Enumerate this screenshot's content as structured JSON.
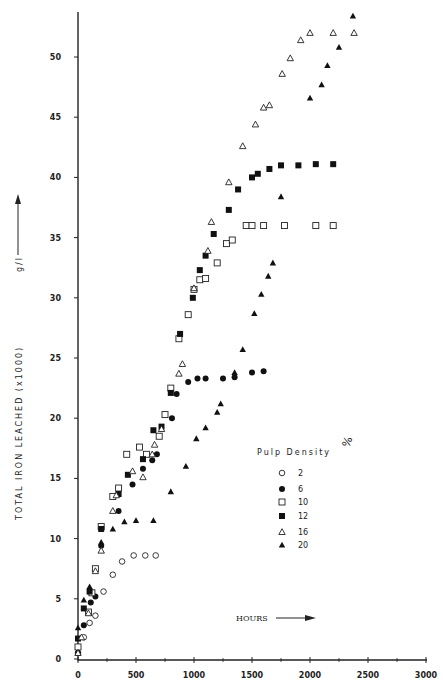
{
  "chart_data": {
    "type": "scatter",
    "title": "",
    "xlabel": "HOURS",
    "ylabel": "TOTAL IRON LEACHED (x1000) g/l",
    "xlim": [
      0,
      3000
    ],
    "ylim": [
      0,
      53
    ],
    "x_ticks": [
      "0",
      "500",
      "1000",
      "1500",
      "2000",
      "2500",
      "3000"
    ],
    "y_ticks": [
      "0",
      "5",
      "10",
      "15",
      "20",
      "25",
      "30",
      "35",
      "40",
      "45",
      "50"
    ],
    "grid": false,
    "legend": {
      "title": "Pulp Density",
      "unit": "%",
      "position": "right-middle",
      "entries": [
        {
          "label": "2",
          "marker": "open-circle"
        },
        {
          "label": "6",
          "marker": "filled-circle"
        },
        {
          "label": "10",
          "marker": "open-square"
        },
        {
          "label": "12",
          "marker": "filled-square"
        },
        {
          "label": "16",
          "marker": "open-triangle"
        },
        {
          "label": "20",
          "marker": "filled-triangle"
        }
      ]
    },
    "series": [
      {
        "name": "2",
        "marker": "open-circle",
        "points": [
          [
            0,
            0.5
          ],
          [
            50,
            1.8
          ],
          [
            100,
            3
          ],
          [
            150,
            3.6
          ],
          [
            220,
            5.6
          ],
          [
            300,
            7
          ],
          [
            380,
            8.1
          ],
          [
            480,
            8.6
          ],
          [
            580,
            8.6
          ],
          [
            670,
            8.6
          ]
        ]
      },
      {
        "name": "6",
        "marker": "filled-circle",
        "points": [
          [
            0,
            0.5
          ],
          [
            50,
            2.8
          ],
          [
            110,
            4.7
          ],
          [
            150,
            5.2
          ],
          [
            200,
            9.4
          ],
          [
            350,
            12.3
          ],
          [
            470,
            14.5
          ],
          [
            560,
            15.8
          ],
          [
            640,
            16.5
          ],
          [
            680,
            17
          ],
          [
            810,
            20
          ],
          [
            850,
            22
          ],
          [
            950,
            23
          ],
          [
            1030,
            23.3
          ],
          [
            1100,
            23.3
          ],
          [
            1250,
            23.3
          ],
          [
            1350,
            23.4
          ],
          [
            1500,
            23.8
          ],
          [
            1600,
            23.9
          ]
        ]
      },
      {
        "name": "10",
        "marker": "open-square",
        "points": [
          [
            0,
            1
          ],
          [
            90,
            3.9
          ],
          [
            120,
            5.5
          ],
          [
            150,
            7.5
          ],
          [
            200,
            11
          ],
          [
            300,
            13.5
          ],
          [
            350,
            14.2
          ],
          [
            420,
            17
          ],
          [
            530,
            17.6
          ],
          [
            590,
            17
          ],
          [
            700,
            18.5
          ],
          [
            750,
            20.3
          ],
          [
            800,
            22.5
          ],
          [
            870,
            26.6
          ],
          [
            950,
            28.6
          ],
          [
            1000,
            30.7
          ],
          [
            1050,
            31.5
          ],
          [
            1100,
            31.6
          ],
          [
            1200,
            32.9
          ],
          [
            1280,
            34.5
          ],
          [
            1330,
            34.8
          ],
          [
            1450,
            36
          ],
          [
            1500,
            36
          ],
          [
            1600,
            36
          ],
          [
            1780,
            36
          ],
          [
            2050,
            36
          ],
          [
            2200,
            36
          ]
        ]
      },
      {
        "name": "12",
        "marker": "filled-square",
        "points": [
          [
            0,
            1.7
          ],
          [
            50,
            4.2
          ],
          [
            100,
            5.6
          ],
          [
            200,
            10.8
          ],
          [
            350,
            13.7
          ],
          [
            430,
            15.3
          ],
          [
            560,
            16.6
          ],
          [
            650,
            19
          ],
          [
            720,
            19.3
          ],
          [
            800,
            22.1
          ],
          [
            880,
            27
          ],
          [
            990,
            30
          ],
          [
            1050,
            32.3
          ],
          [
            1100,
            33.5
          ],
          [
            1170,
            35.3
          ],
          [
            1300,
            37.3
          ],
          [
            1380,
            39
          ],
          [
            1500,
            40
          ],
          [
            1550,
            40.3
          ],
          [
            1650,
            40.7
          ],
          [
            1750,
            41
          ],
          [
            1900,
            41
          ],
          [
            2050,
            41.1
          ],
          [
            2200,
            41.1
          ]
        ]
      },
      {
        "name": "16",
        "marker": "open-triangle",
        "points": [
          [
            0,
            0.5
          ],
          [
            30,
            1.8
          ],
          [
            90,
            3.8
          ],
          [
            150,
            7.3
          ],
          [
            200,
            9
          ],
          [
            300,
            12.3
          ],
          [
            330,
            13.6
          ],
          [
            470,
            15.6
          ],
          [
            560,
            15.1
          ],
          [
            640,
            17
          ],
          [
            660,
            17.8
          ],
          [
            720,
            19.1
          ],
          [
            870,
            23.7
          ],
          [
            900,
            24.5
          ],
          [
            1000,
            30.8
          ],
          [
            1120,
            33.9
          ],
          [
            1150,
            36.3
          ],
          [
            1300,
            39.6
          ],
          [
            1420,
            42.6
          ],
          [
            1530,
            44.4
          ],
          [
            1600,
            45.8
          ],
          [
            1650,
            46
          ],
          [
            1760,
            48.6
          ],
          [
            1830,
            49.9
          ],
          [
            1920,
            51.4
          ],
          [
            2000,
            52
          ],
          [
            2200,
            52
          ],
          [
            2380,
            52
          ]
        ]
      },
      {
        "name": "20",
        "marker": "filled-triangle",
        "points": [
          [
            0,
            2.6
          ],
          [
            50,
            4.9
          ],
          [
            100,
            6
          ],
          [
            200,
            9.7
          ],
          [
            300,
            10.8
          ],
          [
            400,
            11.4
          ],
          [
            500,
            11.5
          ],
          [
            650,
            11.5
          ],
          [
            800,
            13.9
          ],
          [
            930,
            16
          ],
          [
            1020,
            18.3
          ],
          [
            1100,
            19.2
          ],
          [
            1200,
            20.5
          ],
          [
            1230,
            21.2
          ],
          [
            1350,
            23.8
          ],
          [
            1420,
            25.7
          ],
          [
            1520,
            28.7
          ],
          [
            1580,
            30.3
          ],
          [
            1640,
            31.8
          ],
          [
            1680,
            32.9
          ],
          [
            1750,
            38.4
          ],
          [
            2000,
            46.6
          ],
          [
            2100,
            47.7
          ],
          [
            2150,
            49.3
          ],
          [
            2250,
            50.8
          ],
          [
            2370,
            53.4
          ]
        ]
      }
    ]
  },
  "labels": {
    "y_axis": "TOTAL IRON LEACHED",
    "y_scale": "(x1000)",
    "y_unit": "g/l",
    "x_axis": "HOURS",
    "legend_title": "Pulp Density",
    "legend_unit": "%"
  }
}
